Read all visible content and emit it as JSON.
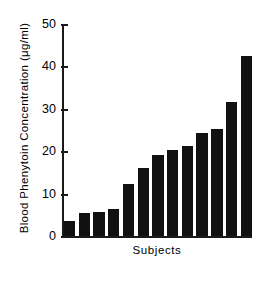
{
  "chart_data": {
    "type": "bar",
    "title": "",
    "subtitle": "",
    "xlabel": "Subjects",
    "ylabel": "Blood Phenytoin Concentration (μg/ml)",
    "categories": [
      "1",
      "2",
      "3",
      "4",
      "5",
      "6",
      "7",
      "8",
      "9",
      "10",
      "11",
      "12",
      "13"
    ],
    "values": [
      3.5,
      5.5,
      5.7,
      6.3,
      12.3,
      16.0,
      19.0,
      20.3,
      21.3,
      24.3,
      25.3,
      31.5,
      42.5
    ],
    "units": "μg/ml",
    "ylim": [
      0,
      50
    ],
    "yticks": [
      0,
      10,
      20,
      30,
      40,
      50
    ],
    "ytick_labels": [
      "0",
      "10",
      "20",
      "30",
      "40",
      "50"
    ],
    "xtick_labels": [],
    "grid": false,
    "legend": false,
    "legend_position": "none",
    "bar_color": "#111111",
    "axis_color": "#1a1a1a",
    "background_color": "#ffffff",
    "spines": [
      "left",
      "bottom"
    ],
    "sorted": "ascending",
    "n_bars": 13
  },
  "axes": {
    "y_title": "Blood Phenytoin Concentration (μg/ml)",
    "x_title": "Subjects"
  }
}
